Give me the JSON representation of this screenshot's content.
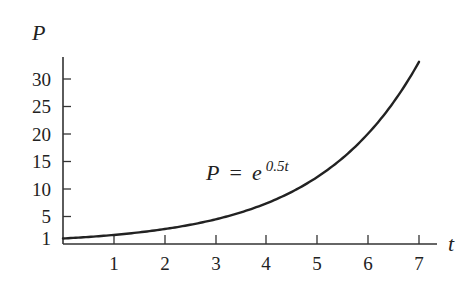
{
  "chart_data": {
    "type": "line",
    "title": "",
    "xlabel": "t",
    "ylabel": "P",
    "xlim": [
      0,
      7
    ],
    "ylim": [
      0,
      33
    ],
    "grid": false,
    "legend": null,
    "x_ticks": [
      1,
      2,
      3,
      4,
      5,
      6,
      7
    ],
    "y_ticks": [
      1,
      5,
      10,
      15,
      20,
      25,
      30
    ],
    "annotation": {
      "text_lhs": "P",
      "text_eq": "=",
      "text_base": "e",
      "text_exp": "0.5t",
      "x": 4.1,
      "y": 11.5
    },
    "series": [
      {
        "name": "P = e^(0.5t)",
        "function": "exp(0.5*t)",
        "x": [
          0,
          0.5,
          1,
          1.5,
          2,
          2.5,
          3,
          3.5,
          4,
          4.5,
          5,
          5.5,
          6,
          6.5,
          7
        ],
        "values": [
          1.0,
          1.28,
          1.65,
          2.12,
          2.72,
          3.49,
          4.48,
          5.75,
          7.39,
          9.49,
          12.18,
          15.64,
          20.09,
          25.79,
          33.12
        ]
      }
    ]
  },
  "labels": {
    "y_axis": "P",
    "x_axis": "t",
    "x_ticks": [
      "1",
      "2",
      "3",
      "4",
      "5",
      "6",
      "7"
    ],
    "y_ticks": [
      "30",
      "25",
      "20",
      "15",
      "10",
      "5",
      "1"
    ],
    "equation_lhs": "P",
    "equation_eq": "=",
    "equation_base": "e",
    "equation_exp": "0.5t"
  },
  "colors": {
    "line": "#222222",
    "axis": "#333333",
    "text": "#222222",
    "background": "#ffffff"
  }
}
